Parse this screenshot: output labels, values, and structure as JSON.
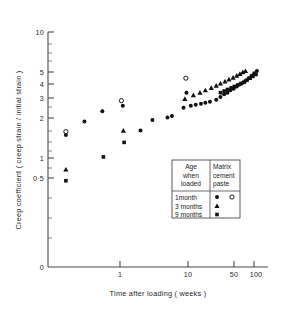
{
  "figure": {
    "background": "#ffffff",
    "ink_color": "#111111",
    "width": 289,
    "height": 314
  },
  "chart_data": {
    "type": "scatter",
    "title": "",
    "xlabel": "Time after loading ( weeks )",
    "ylabel": "Creep coefficient ( creep strain / initial strain )",
    "xscale": "log",
    "yscale": "log",
    "xlim": [
      0.12,
      130
    ],
    "ylim": [
      0.2,
      10
    ],
    "grid": false,
    "legend_position": "lower-right-inside",
    "x_ticklabels": [
      "1",
      "10",
      "50",
      "100"
    ],
    "x_tickvalues": [
      1,
      10,
      50,
      100
    ],
    "y_ticklabels": [
      "10",
      "5",
      "4",
      "3",
      "2",
      "1",
      "0·5",
      "0"
    ],
    "y_tickvalues": [
      10,
      5,
      4,
      3,
      2,
      1,
      0.5,
      0
    ],
    "series": [
      {
        "name": "1month",
        "column": "Matrix",
        "marker": "filled-circle",
        "color": "#111111",
        "points": [
          [
            0.16,
            1.52
          ],
          [
            0.3,
            1.95
          ],
          [
            0.55,
            2.35
          ],
          [
            1.1,
            2.6
          ],
          [
            2.0,
            1.65
          ],
          [
            3.0,
            2.0
          ],
          [
            5.0,
            2.1
          ],
          [
            5.8,
            2.15
          ],
          [
            8.6,
            2.5
          ],
          [
            9.5,
            3.3
          ],
          [
            11.0,
            2.6
          ],
          [
            13.0,
            2.65
          ],
          [
            15.5,
            2.7
          ],
          [
            18.0,
            2.75
          ],
          [
            21.0,
            2.8
          ],
          [
            26.0,
            2.9
          ],
          [
            30.0,
            3.05
          ],
          [
            34.0,
            3.2
          ],
          [
            38.0,
            3.3
          ],
          [
            42.0,
            3.45
          ],
          [
            47.0,
            3.55
          ],
          [
            52.0,
            3.7
          ],
          [
            58.0,
            3.85
          ],
          [
            64.0,
            3.95
          ],
          [
            70.0,
            4.1
          ],
          [
            78.0,
            4.3
          ],
          [
            86.0,
            4.5
          ],
          [
            94.0,
            4.7
          ],
          [
            103.0,
            4.9
          ]
        ]
      },
      {
        "name": "1month",
        "column": "cement paste",
        "marker": "open-circle",
        "color": "#111111",
        "points": [
          [
            0.16,
            1.62
          ],
          [
            1.05,
            2.85
          ],
          [
            9.3,
            4.3
          ]
        ]
      },
      {
        "name": "3months",
        "column": "Matrix",
        "marker": "triangle",
        "color": "#111111",
        "points": [
          [
            0.16,
            0.81
          ],
          [
            1.12,
            1.65
          ],
          [
            9.0,
            2.95
          ],
          [
            12.0,
            3.15
          ],
          [
            15.0,
            3.3
          ],
          [
            18.0,
            3.45
          ],
          [
            22.0,
            3.6
          ],
          [
            26.0,
            3.75
          ],
          [
            30.0,
            3.9
          ],
          [
            35.0,
            4.05
          ],
          [
            40.0,
            4.2
          ],
          [
            46.0,
            4.35
          ],
          [
            52.0,
            4.5
          ],
          [
            58.0,
            4.65
          ],
          [
            64.0,
            4.8
          ],
          [
            70.0,
            4.9
          ]
        ]
      },
      {
        "name": "9months",
        "column": "Matrix",
        "marker": "square",
        "color": "#111111",
        "points": [
          [
            0.16,
            0.66
          ],
          [
            0.57,
            1.02
          ],
          [
            1.15,
            1.33
          ],
          [
            30.0,
            3.3
          ],
          [
            34.0,
            3.4
          ],
          [
            38.0,
            3.5
          ],
          [
            43.0,
            3.6
          ],
          [
            48.0,
            3.7
          ],
          [
            54.0,
            3.8
          ],
          [
            60.0,
            3.9
          ],
          [
            67.0,
            4.0
          ],
          [
            74.0,
            4.15
          ],
          [
            82.0,
            4.3
          ],
          [
            90.0,
            4.45
          ],
          [
            100.0,
            4.6
          ]
        ]
      }
    ]
  },
  "legend": {
    "header_col1": [
      "Age",
      "when",
      "loaded"
    ],
    "header_col2": [
      "Matrix",
      "cement",
      "paste"
    ],
    "rows": [
      {
        "label": "1month",
        "matrix_marker": "filled-circle",
        "paste_marker": "open-circle"
      },
      {
        "label": "3 months",
        "matrix_marker": "triangle",
        "paste_marker": "none"
      },
      {
        "label": "9 months",
        "matrix_marker": "square",
        "paste_marker": "none"
      }
    ]
  }
}
